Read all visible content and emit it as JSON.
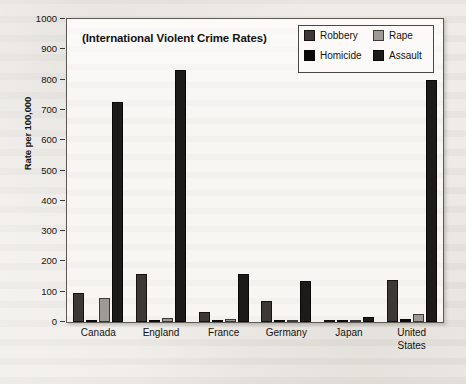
{
  "chart_data": {
    "type": "bar",
    "title": "(International Violent Crime Rates)",
    "xlabel": "",
    "ylabel": "Rate per 100,000",
    "ylim": [
      0,
      1000
    ],
    "ytick_step": 100,
    "yticks": [
      1000,
      900,
      800,
      700,
      600,
      500,
      400,
      300,
      200,
      100,
      0
    ],
    "ytick_labels": [
      "1000",
      "900",
      "800",
      "700",
      "600",
      "500",
      "400",
      "300",
      "200",
      "100",
      "0"
    ],
    "grid": false,
    "legend_position": "upper right",
    "categories": [
      "Canada",
      "England",
      "France",
      "Germany",
      "Japan",
      "United States"
    ],
    "category_lines": [
      [
        "Canada"
      ],
      [
        "England"
      ],
      [
        "France"
      ],
      [
        "Germany"
      ],
      [
        "Japan"
      ],
      [
        "United",
        "States"
      ]
    ],
    "series_order_in_group": [
      "Robbery",
      "Homicide",
      "Rape",
      "Assault"
    ],
    "series": [
      {
        "name": "Robbery",
        "color": "#3b3835",
        "values": [
          95,
          158,
          33,
          70,
          2,
          140
        ]
      },
      {
        "name": "Homicide",
        "color": "#0a0908",
        "values": [
          2,
          2,
          2,
          1,
          1,
          9
        ]
      },
      {
        "name": "Rape",
        "color": "#9d9a95",
        "values": [
          78,
          14,
          11,
          6,
          1,
          26
        ]
      },
      {
        "name": "Assault",
        "color": "#1d1b19",
        "values": [
          725,
          833,
          158,
          135,
          16,
          798
        ]
      }
    ]
  },
  "legend": {
    "entries": [
      {
        "label": "Robbery",
        "swatch": "robbery"
      },
      {
        "label": "Rape",
        "swatch": "rape"
      },
      {
        "label": "Homicide",
        "swatch": "homicide"
      },
      {
        "label": "Assault",
        "swatch": "assault"
      }
    ]
  },
  "colors": {
    "page_background": "#efece7",
    "plot_background": "#f7f6f3",
    "axis": "#5d5a55",
    "text": "#15120f"
  }
}
